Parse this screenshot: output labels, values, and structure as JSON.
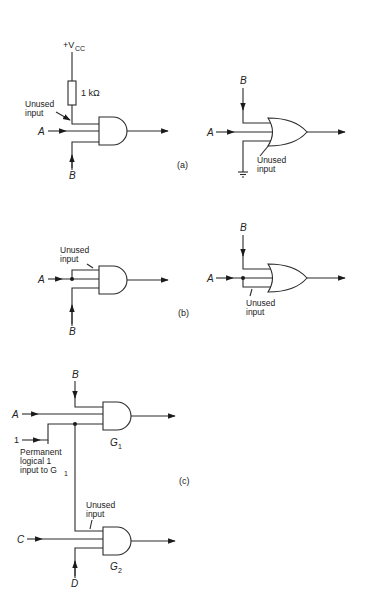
{
  "figure": {
    "panels": [
      {
        "id": "a",
        "label": "(a)",
        "and_circuit": {
          "supply_label": "+V",
          "supply_sub": "CC",
          "resistor_label": "1 kΩ",
          "unused_label_line1": "Unused",
          "unused_label_line2": "input",
          "input_a": "A",
          "input_b": "B"
        },
        "or_circuit": {
          "input_a": "A",
          "input_b": "B",
          "unused_label_line1": "Unused",
          "unused_label_line2": "input"
        }
      },
      {
        "id": "b",
        "label": "(b)",
        "and_circuit": {
          "unused_label_line1": "Unused",
          "unused_label_line2": "input",
          "input_a": "A",
          "input_b": "B"
        },
        "or_circuit": {
          "input_a": "A",
          "input_b": "B",
          "unused_label_line1": "Unused",
          "unused_label_line2": "input"
        }
      },
      {
        "id": "c",
        "label": "(c)",
        "gate1": {
          "name": "G",
          "sub": "1",
          "input_a": "A",
          "input_b": "B",
          "logic_one": "1",
          "note_line1": "Permanent",
          "note_line2": "logical 1",
          "note_line3": "input to G",
          "note_sub": "1"
        },
        "gate2": {
          "name": "G",
          "sub": "2",
          "input_c": "C",
          "input_d": "D",
          "unused_label_line1": "Unused",
          "unused_label_line2": "input"
        }
      }
    ]
  }
}
